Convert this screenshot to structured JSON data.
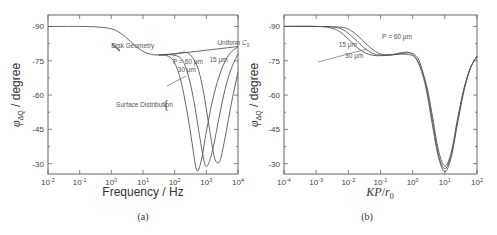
{
  "chart_data": [
    {
      "id": "a",
      "type": "line",
      "panel_label": "(a)",
      "title": "",
      "xlabel": "Frequency / Hz",
      "ylabel": "φ_ΔQ / degree",
      "xscale": "log",
      "xlim_log10": [
        -2,
        4
      ],
      "ylim": [
        -95,
        -25.5
      ],
      "y_inverted": true,
      "x_ticks": [
        "10^-2",
        "10^-1",
        "10^0",
        "10^1",
        "10^2",
        "10^3",
        "10^4"
      ],
      "y_ticks": [
        "-90",
        "-75",
        "-60",
        "-45",
        "-30"
      ],
      "y_tick_values": [
        -90,
        -75,
        -60,
        -45,
        -30
      ],
      "annotations": [
        {
          "text": "Disk Geometry",
          "at_log10x": 0.0,
          "y": -80.5
        },
        {
          "text": "Uniform C0",
          "at_log10x": 3.35,
          "y": -82
        },
        {
          "text": "P = 60 μm",
          "at_log10x": 1.95,
          "y": -73.5
        },
        {
          "text": "15 μm",
          "at_log10x": 3.1,
          "y": -74.5
        },
        {
          "text": "30 μm",
          "at_log10x": 2.1,
          "y": -70
        },
        {
          "text": "Surface Distribution",
          "at_log10x": 0.15,
          "y": -55
        }
      ],
      "series": [
        {
          "name": "Uniform C0 (disk geometry)",
          "log10x": [
            -2,
            -1,
            -0.5,
            0,
            0.3,
            0.6,
            0.9,
            1.2,
            1.5,
            2,
            2.5,
            3,
            3.5,
            4
          ],
          "y": [
            -90,
            -90,
            -89.8,
            -89,
            -87,
            -83.5,
            -80,
            -78,
            -77.5,
            -78,
            -78.8,
            -79.6,
            -80.4,
            -81.2
          ]
        },
        {
          "name": "P = 60 μm",
          "log10x": [
            1.5,
            1.8,
            2.0,
            2.2,
            2.4,
            2.55,
            2.7,
            2.85,
            3.0,
            3.2,
            3.4,
            3.6,
            3.8,
            4.0
          ],
          "y": [
            -77.6,
            -77,
            -74,
            -66,
            -52,
            -39,
            -27,
            -32,
            -44,
            -58,
            -68,
            -75,
            -79,
            -81
          ]
        },
        {
          "name": "P = 30 μm",
          "log10x": [
            1.5,
            1.9,
            2.2,
            2.4,
            2.6,
            2.8,
            2.95,
            3.05,
            3.2,
            3.4,
            3.6,
            3.8,
            4.0
          ],
          "y": [
            -77.6,
            -77.6,
            -76,
            -70,
            -58,
            -41,
            -30,
            -29.5,
            -36,
            -50,
            -63,
            -72,
            -78
          ]
        },
        {
          "name": "P = 15 μm",
          "log10x": [
            1.5,
            2.0,
            2.4,
            2.7,
            2.9,
            3.1,
            3.25,
            3.35,
            3.45,
            3.6,
            3.8,
            4.0
          ],
          "y": [
            -77.6,
            -78,
            -78.5,
            -73,
            -62,
            -45,
            -33,
            -30.5,
            -32,
            -42,
            -57,
            -70
          ]
        }
      ]
    },
    {
      "id": "b",
      "type": "line",
      "panel_label": "(b)",
      "title": "",
      "xlabel": "KP/r0",
      "ylabel": "φ_ΔQ / degree",
      "xscale": "log",
      "xlim_log10": [
        -4,
        2
      ],
      "ylim": [
        -95,
        -25.5
      ],
      "y_inverted": true,
      "x_ticks": [
        "10^-4",
        "10^-3",
        "10^-2",
        "10^-1",
        "10^0",
        "10^1",
        "10^2"
      ],
      "y_ticks": [
        "-90",
        "-75",
        "-60",
        "-45",
        "-30"
      ],
      "y_tick_values": [
        -90,
        -75,
        -60,
        -45,
        -30
      ],
      "annotations": [
        {
          "text": "P = 60 μm",
          "at_log10x": -0.95,
          "y": -84.5
        },
        {
          "text": "15 μm",
          "at_log10x": -2.3,
          "y": -81
        },
        {
          "text": "30 μm",
          "at_log10x": -2.1,
          "y": -76
        }
      ],
      "series": [
        {
          "name": "P = 15 μm",
          "log10x": [
            -4,
            -3,
            -2.6,
            -2.3,
            -2.0,
            -1.7,
            -1.4,
            -1.1,
            -0.8,
            -0.5,
            -0.2,
            0.1,
            0.4,
            0.6,
            0.8,
            1.0,
            1.2,
            1.4,
            1.6,
            1.8,
            2.0
          ],
          "y": [
            -90,
            -90,
            -89.5,
            -88,
            -84.5,
            -80.5,
            -78,
            -77.2,
            -77.4,
            -77.8,
            -77.8,
            -76,
            -66,
            -52,
            -36,
            -29,
            -35,
            -50,
            -63,
            -72,
            -77
          ]
        },
        {
          "name": "P = 30 μm",
          "log10x": [
            -4,
            -3,
            -2.4,
            -2.1,
            -1.8,
            -1.5,
            -1.2,
            -0.9,
            -0.6,
            -0.3,
            0.0,
            0.2,
            0.4,
            0.6,
            0.8,
            1.0,
            1.2,
            1.4,
            1.6,
            1.8,
            2.0
          ],
          "y": [
            -90,
            -90,
            -89.6,
            -88,
            -84.5,
            -80.5,
            -78,
            -77.4,
            -77.6,
            -78.2,
            -78.2,
            -75,
            -65,
            -50,
            -34,
            -27.8,
            -34,
            -49,
            -63,
            -72,
            -77
          ]
        },
        {
          "name": "P = 60 μm",
          "log10x": [
            -4,
            -3,
            -2.2,
            -1.9,
            -1.6,
            -1.3,
            -1.0,
            -0.7,
            -0.4,
            -0.1,
            0.15,
            0.4,
            0.6,
            0.8,
            1.0,
            1.2,
            1.4,
            1.6,
            1.8,
            2.0
          ],
          "y": [
            -90,
            -90,
            -89.6,
            -88,
            -84.5,
            -80.5,
            -78,
            -77.6,
            -78.4,
            -78.6,
            -75,
            -64,
            -48,
            -33,
            -26.5,
            -33,
            -48,
            -62,
            -72,
            -77
          ]
        }
      ]
    }
  ]
}
